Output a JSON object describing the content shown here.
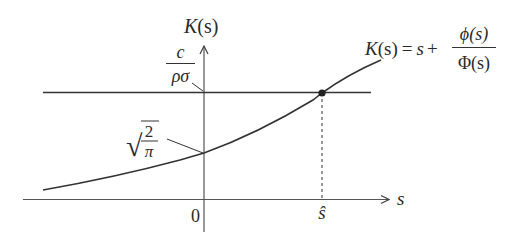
{
  "diagram": {
    "type": "function-plot",
    "y_axis_label": {
      "func": "K",
      "arg": "(s)"
    },
    "x_axis_label": "s",
    "origin_label": "0",
    "threshold_label": {
      "numerator": "c",
      "denominator": "ρσ"
    },
    "intercept_label": {
      "radical": "√",
      "numerator": "2",
      "denominator": "π"
    },
    "intersection_label": "ŝ",
    "formula": {
      "lhs_func": "K",
      "lhs_arg": "(s)",
      "equals": "=",
      "term": "s",
      "plus": "+",
      "numerator": "ϕ(s)",
      "denominator": "Φ(s)"
    },
    "colors": {
      "stroke": "#2a2a2a",
      "axis": "#555555",
      "background": "#ffffff"
    }
  }
}
